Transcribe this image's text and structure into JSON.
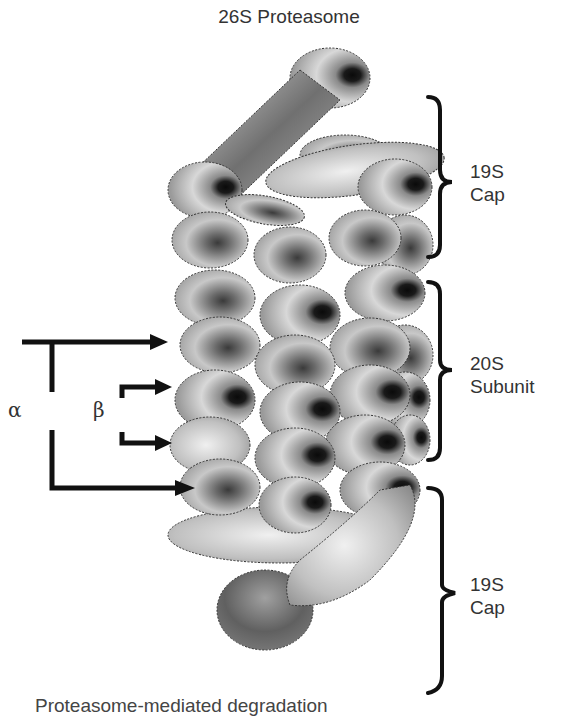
{
  "title": "26S Proteasome",
  "labels": {
    "top_cap": [
      "19S",
      "Cap"
    ],
    "core": [
      "20S",
      "Subunit"
    ],
    "bottom_cap": [
      "19S",
      "Cap"
    ],
    "alpha": "α",
    "beta": "β"
  },
  "caption": "Proteasome-mediated degradation",
  "colors": {
    "ink": "#111111",
    "text": "#333333",
    "shade_dark": "#111111",
    "shade_mid": "#7a7a7a",
    "shade_light": "#e8e8e8"
  }
}
